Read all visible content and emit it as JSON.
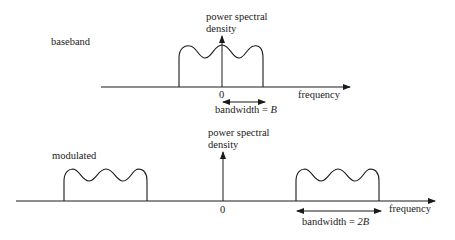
{
  "diagram": {
    "panels": [
      {
        "id": "baseband",
        "label": "baseband",
        "y_axis_label_line1": "power spectral",
        "y_axis_label_line2": "density",
        "x_axis_label": "frequency",
        "origin_label": "0",
        "bandwidth_text": "bandwidth = ",
        "bandwidth_symbol": "B"
      },
      {
        "id": "modulated",
        "label": "modulated",
        "y_axis_label_line1": "power spectral",
        "y_axis_label_line2": "density",
        "x_axis_label": "frequency",
        "origin_label": "0",
        "bandwidth_text": "bandwidth = ",
        "bandwidth_symbol": "2B"
      }
    ],
    "colors": {
      "ink": "#1a1a1a",
      "background": "#ffffff"
    }
  }
}
